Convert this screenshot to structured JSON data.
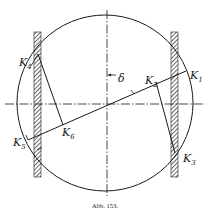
{
  "figure": {
    "caption": "Abb. 153.",
    "angle_label": "δ",
    "colors": {
      "ink": "#1a1a1a",
      "hatch": "#555555",
      "background": "#ffffff"
    }
  },
  "labels": {
    "k1": {
      "main": "K",
      "sub": "1"
    },
    "k2": {
      "main": "K",
      "sub": "2"
    },
    "k3": {
      "main": "K",
      "sub": "3"
    },
    "k4": {
      "main": "K",
      "sub": "4"
    },
    "k5": {
      "main": "K",
      "sub": "5"
    },
    "k6": {
      "main": "K",
      "sub": "6"
    }
  },
  "geometry": {
    "circle": {
      "cx": 105,
      "cy": 103,
      "r": 88
    },
    "walls": [
      {
        "side": "left",
        "x": 34,
        "y": 32,
        "w": 7,
        "h": 145
      },
      {
        "side": "right",
        "x": 171,
        "y": 32,
        "w": 7,
        "h": 145
      }
    ],
    "axes": {
      "horizontal_y": 104,
      "vertical_x": 107
    }
  }
}
